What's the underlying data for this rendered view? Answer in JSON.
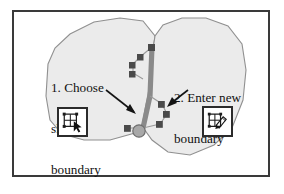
{
  "figure": {
    "type": "instructional-diagram",
    "frame_border_color": "#3a3a3a",
    "background_color": "#ffffff"
  },
  "callouts": [
    {
      "id": "step-1",
      "number": "1.",
      "line1": "1. Choose",
      "line2": "shared",
      "line3": "boundary",
      "full_text": "1. Choose shared boundary",
      "arrow": "points down-right to the thick shared boundary line"
    },
    {
      "id": "step-2",
      "number": "2.",
      "line1": "2. Enter new",
      "line2": "boundary",
      "full_text": "2. Enter new boundary",
      "arrow": "points down-left to the new vertex chain"
    }
  ],
  "tools": [
    {
      "id": "select-boundary-tool",
      "icon": "polygon-select-arrow-icon",
      "description": "polygon with arrow cursor"
    },
    {
      "id": "draw-boundary-tool",
      "icon": "polygon-pen-draw-icon",
      "description": "polygon with pen drawing"
    }
  ],
  "graphics": {
    "polygon_fill": "#ebebeb",
    "polygon_stroke": "#8c8c8c",
    "shared_boundary_color": "#8a8a8a",
    "new_boundary_line_color": "#8f8f8f",
    "vertex_handle_color": "#4a4a4a",
    "junction_node_fill": "#a8a8a8",
    "junction_node_stroke": "#6e6e6e",
    "arrow_color": "#1a1a1a",
    "left_polygon_label": "left region polygon",
    "right_polygon_label": "right region polygon",
    "shared_boundary_label": "thick highlighted shared boundary",
    "new_boundary_label": "new boundary vertex chain"
  }
}
